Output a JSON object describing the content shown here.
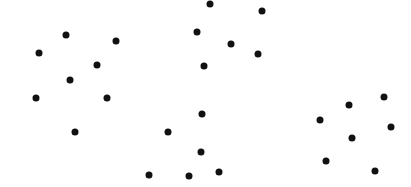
{
  "chart_data": {
    "type": "scatter",
    "title": "",
    "xlabel": "",
    "ylabel": "",
    "grid": false,
    "legend": null,
    "xlim": [
      0,
      411
    ],
    "ylim": [
      187,
      0
    ],
    "marker_color": "#111111",
    "points": [
      {
        "x": 210,
        "y": 4
      },
      {
        "x": 262,
        "y": 11
      },
      {
        "x": 66,
        "y": 35
      },
      {
        "x": 197,
        "y": 32
      },
      {
        "x": 116,
        "y": 41
      },
      {
        "x": 231,
        "y": 44
      },
      {
        "x": 39,
        "y": 53
      },
      {
        "x": 258,
        "y": 54
      },
      {
        "x": 97,
        "y": 65
      },
      {
        "x": 204,
        "y": 66
      },
      {
        "x": 70,
        "y": 80
      },
      {
        "x": 36,
        "y": 98
      },
      {
        "x": 107,
        "y": 98
      },
      {
        "x": 384,
        "y": 97
      },
      {
        "x": 349,
        "y": 105
      },
      {
        "x": 202,
        "y": 114
      },
      {
        "x": 320,
        "y": 120
      },
      {
        "x": 391,
        "y": 127
      },
      {
        "x": 75,
        "y": 132
      },
      {
        "x": 168,
        "y": 132
      },
      {
        "x": 352,
        "y": 138
      },
      {
        "x": 201,
        "y": 152
      },
      {
        "x": 326,
        "y": 161
      },
      {
        "x": 219,
        "y": 172
      },
      {
        "x": 149,
        "y": 175
      },
      {
        "x": 189,
        "y": 176
      },
      {
        "x": 375,
        "y": 171
      }
    ]
  }
}
